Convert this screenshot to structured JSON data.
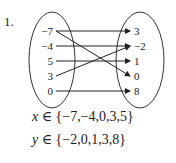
{
  "problem_number": "1.",
  "domain": [
    "−7",
    "−4",
    "5",
    "3",
    "0"
  ],
  "range": [
    "3",
    "−2",
    "1",
    "0",
    "8"
  ],
  "mappings": [
    {
      "from": "−7",
      "to": "3"
    },
    {
      "from": "−7",
      "to": "0"
    },
    {
      "from": "−4",
      "to": "−2"
    },
    {
      "from": "5",
      "to": "1"
    },
    {
      "from": "3",
      "to": "−2"
    },
    {
      "from": "0",
      "to": "8"
    }
  ],
  "x_set": {
    "var": "x",
    "symbol": "∈",
    "values": "{−7,−4,0,3,5}"
  },
  "y_set": {
    "var": "y",
    "symbol": "∈",
    "values": "{−2,0,1,3,8}"
  },
  "colors": {
    "ink": "#222222"
  }
}
